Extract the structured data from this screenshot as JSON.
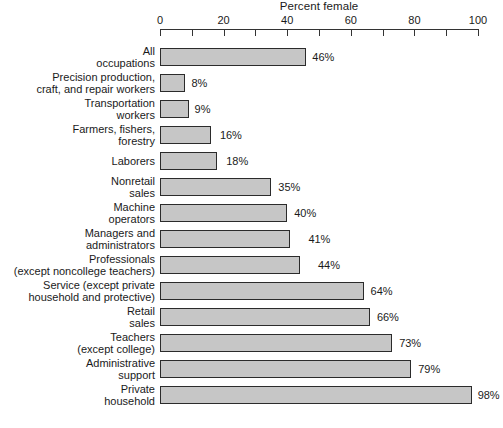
{
  "chart_data": {
    "type": "bar",
    "orientation": "horizontal",
    "title": "Percent female",
    "xlabel": "Percent female",
    "ylabel": "",
    "xlim": [
      0,
      100
    ],
    "xticks": [
      0,
      20,
      40,
      60,
      80,
      100
    ],
    "xtick_labels": [
      "0",
      "20",
      "40",
      "60",
      "80",
      "100"
    ],
    "minor_tick_interval": 10,
    "grid": false,
    "legend": null,
    "bar_fill_color": "#c6c6c6",
    "bar_border_color": "#2b2b2b",
    "value_suffix": "%",
    "categories": [
      "All occupations",
      "Precision production, craft, and repair workers",
      "Transportation workers",
      "Farmers, fishers, forestry",
      "Laborers",
      "Nonretail sales",
      "Machine operators",
      "Managers and administrators",
      "Professionals (except noncollege teachers)",
      "Service (except private household and protective)",
      "Retail sales",
      "Teachers (except college)",
      "Administrative support",
      "Private household"
    ],
    "values": [
      46,
      8,
      9,
      16,
      18,
      35,
      40,
      41,
      44,
      64,
      66,
      73,
      79,
      98
    ],
    "rows": [
      {
        "label_lines": [
          "All",
          "occupations"
        ],
        "value": 46,
        "value_label": "46%",
        "label_offset": 6
      },
      {
        "label_lines": [
          "Precision production,",
          "craft, and repair workers"
        ],
        "value": 8,
        "value_label": "8%",
        "label_offset": 6
      },
      {
        "label_lines": [
          "Transportation",
          "workers"
        ],
        "value": 9,
        "value_label": "9%",
        "label_offset": 6
      },
      {
        "label_lines": [
          "Farmers, fishers,",
          "forestry"
        ],
        "value": 16,
        "value_label": "16%",
        "label_offset": 9
      },
      {
        "label_lines": [
          "Laborers"
        ],
        "value": 18,
        "value_label": "18%",
        "label_offset": 9
      },
      {
        "label_lines": [
          "Nonretail",
          "sales"
        ],
        "value": 35,
        "value_label": "35%",
        "label_offset": 7
      },
      {
        "label_lines": [
          "Machine",
          "operators"
        ],
        "value": 40,
        "value_label": "40%",
        "label_offset": 7
      },
      {
        "label_lines": [
          "Managers and",
          "administrators"
        ],
        "value": 41,
        "value_label": "41%",
        "label_offset": 18
      },
      {
        "label_lines": [
          "Professionals",
          "(except noncollege teachers)"
        ],
        "value": 44,
        "value_label": "44%",
        "label_offset": 18
      },
      {
        "label_lines": [
          "Service (except private",
          "household and protective)"
        ],
        "value": 64,
        "value_label": "64%",
        "label_offset": 7
      },
      {
        "label_lines": [
          "Retail",
          "sales"
        ],
        "value": 66,
        "value_label": "66%",
        "label_offset": 7
      },
      {
        "label_lines": [
          "Teachers",
          "(except college)"
        ],
        "value": 73,
        "value_label": "73%",
        "label_offset": 7
      },
      {
        "label_lines": [
          "Administrative",
          "support"
        ],
        "value": 79,
        "value_label": "79%",
        "label_offset": 7
      },
      {
        "label_lines": [
          "Private",
          "household"
        ],
        "value": 98,
        "value_label": "98%",
        "label_offset": 6
      }
    ]
  }
}
